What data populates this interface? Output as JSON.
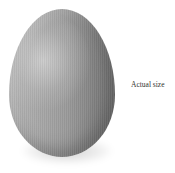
{
  "illustration": {
    "subject": "egg",
    "colors": {
      "highlight": "#c8c8c8",
      "midtone": "#9a9a9a",
      "shadow": "#707070",
      "background": "#ffffff"
    }
  },
  "caption": {
    "text": "Actual size"
  }
}
